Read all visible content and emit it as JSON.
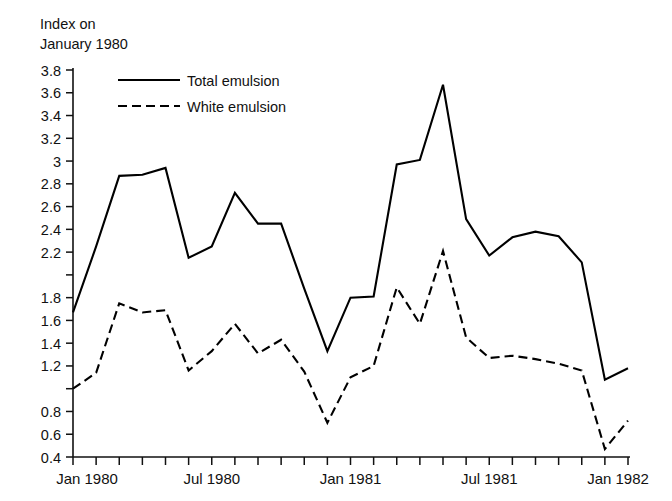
{
  "chart_data": {
    "type": "line",
    "title": "",
    "ylabel": "Index on\nJanuary 1980",
    "xlabel": "",
    "ylim": [
      0.4,
      3.8
    ],
    "ytick_step": 0.2,
    "grid": false,
    "legend_position": "top-left-inside",
    "yticks": [
      "3.8",
      "3.6",
      "3.4",
      "3.2",
      "3",
      "2.8",
      "2.6",
      "2.4",
      "2.2",
      "",
      "1.8",
      "1.6",
      "1.4",
      "1.2",
      "",
      "0.8",
      "0.6",
      "0.4"
    ],
    "ytick_values": [
      3.8,
      3.6,
      3.4,
      3.2,
      3.0,
      2.8,
      2.6,
      2.4,
      2.2,
      2.0,
      1.8,
      1.6,
      1.4,
      1.2,
      1.0,
      0.8,
      0.6,
      0.4
    ],
    "xticks": [
      "Jan 1980",
      "Jul 1980",
      "Jan 1981",
      "Jul 1981",
      "Jan 1982"
    ],
    "xtick_indices": [
      0,
      6,
      12,
      18,
      24
    ],
    "x": [
      "Jan 1980",
      "Feb 1980",
      "Mar 1980",
      "Apr 1980",
      "May 1980",
      "Jun 1980",
      "Jul 1980",
      "Aug 1980",
      "Sep 1980",
      "Oct 1980",
      "Nov 1980",
      "Dec 1980",
      "Jan 1981",
      "Feb 1981",
      "Mar 1981",
      "Apr 1981",
      "May 1981",
      "Jun 1981",
      "Jul 1981",
      "Aug 1981",
      "Sep 1981",
      "Oct 1981",
      "Nov 1981",
      "Dec 1981",
      "Jan 1982"
    ],
    "series": [
      {
        "name": "Total emulsion",
        "style": "solid",
        "color": "#000000",
        "values": [
          1.67,
          2.25,
          2.87,
          2.88,
          2.94,
          2.15,
          2.25,
          2.72,
          2.45,
          2.45,
          1.88,
          1.33,
          1.8,
          1.81,
          2.97,
          3.01,
          3.67,
          2.49,
          2.17,
          2.33,
          2.38,
          2.34,
          2.11,
          1.08,
          1.18
        ]
      },
      {
        "name": "White emulsion",
        "style": "dashed",
        "color": "#000000",
        "values": [
          1.0,
          1.14,
          1.75,
          1.67,
          1.69,
          1.16,
          1.33,
          1.57,
          1.31,
          1.43,
          1.15,
          0.7,
          1.1,
          1.2,
          1.89,
          1.57,
          2.21,
          1.45,
          1.27,
          1.29,
          1.26,
          1.22,
          1.16,
          0.47,
          0.72
        ]
      }
    ]
  },
  "legend": {
    "items": [
      {
        "label": "Total emulsion",
        "style": "solid"
      },
      {
        "label": "White emulsion",
        "style": "dashed"
      }
    ]
  }
}
